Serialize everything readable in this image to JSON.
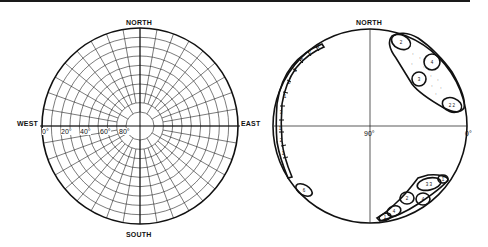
{
  "left_net": {
    "labels": {
      "north": "NORTH",
      "south": "SOUTH",
      "west": "WEST",
      "east": "EAST"
    },
    "ticks": [
      "0°",
      "20°",
      "40°",
      "60°",
      "80°"
    ]
  },
  "right_net": {
    "labels": {
      "north": "NORTH",
      "center": "90°",
      "east_edge": "0°"
    },
    "clusters": [
      {
        "region": "west-rim",
        "cells": [
          "3",
          "1",
          "2",
          "1",
          "2",
          "3",
          "5",
          "3",
          "4",
          "2"
        ]
      },
      {
        "region": "northeast",
        "cells": [
          "2",
          "4",
          "3",
          "2 2"
        ]
      },
      {
        "region": "southwest-single",
        "cells": [
          "6"
        ]
      },
      {
        "region": "southeast",
        "cells": [
          "3 3",
          "1",
          "2",
          "4",
          "4",
          "1"
        ]
      }
    ]
  }
}
